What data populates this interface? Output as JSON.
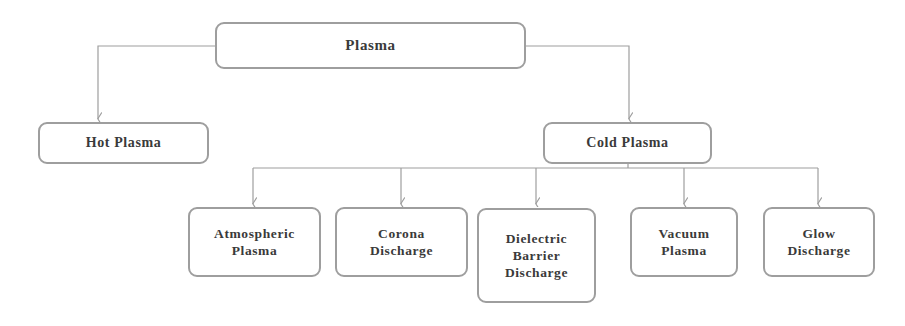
{
  "diagram": {
    "title": "Plasma",
    "type": "tree-flowchart",
    "orientation": "top-down",
    "canvas": {
      "width": 905,
      "height": 326
    },
    "style": {
      "box_border_color": "#9e9e9e",
      "box_fill_color": "#ffffff",
      "connector_color": "#9e9e9e",
      "text_color": "#3a3a3a",
      "background_color": "#ffffff"
    },
    "nodes": [
      {
        "id": "plasma",
        "label": "Plasma",
        "level": "root",
        "x": 215,
        "y": 22,
        "w": 311,
        "h": 47
      },
      {
        "id": "hot-plasma",
        "label": "Hot Plasma",
        "level": "mid",
        "x": 38,
        "y": 122,
        "w": 171,
        "h": 42
      },
      {
        "id": "cold-plasma",
        "label": "Cold Plasma",
        "level": "mid",
        "x": 543,
        "y": 122,
        "w": 169,
        "h": 42
      },
      {
        "id": "atmospheric-plasma",
        "label": "Atmospheric\nPlasma",
        "level": "leaf",
        "x": 188,
        "y": 207,
        "w": 133,
        "h": 70
      },
      {
        "id": "corona-discharge",
        "label": "Corona\nDischarge",
        "level": "leaf",
        "x": 335,
        "y": 207,
        "w": 133,
        "h": 70
      },
      {
        "id": "dielectric-barrier-discharge",
        "label": "Dielectric\nBarrier\nDischarge",
        "level": "leaf",
        "x": 477,
        "y": 208,
        "w": 119,
        "h": 95
      },
      {
        "id": "vacuum-plasma",
        "label": "Vacuum\nPlasma",
        "level": "leaf",
        "x": 630,
        "y": 207,
        "w": 108,
        "h": 70
      },
      {
        "id": "glow-discharge",
        "label": "Glow\nDischarge",
        "level": "leaf",
        "x": 763,
        "y": 207,
        "w": 112,
        "h": 70
      }
    ],
    "edges": [
      {
        "id": "plasma-to-hot-plasma",
        "from": "plasma",
        "to": "hot-plasma"
      },
      {
        "id": "plasma-to-cold-plasma",
        "from": "plasma",
        "to": "cold-plasma"
      },
      {
        "id": "cold-to-atmospheric",
        "from": "cold-plasma",
        "to": "atmospheric-plasma"
      },
      {
        "id": "cold-to-corona",
        "from": "cold-plasma",
        "to": "corona-discharge"
      },
      {
        "id": "cold-to-dbd",
        "from": "cold-plasma",
        "to": "dielectric-barrier-discharge"
      },
      {
        "id": "cold-to-vacuum",
        "from": "cold-plasma",
        "to": "vacuum-plasma"
      },
      {
        "id": "cold-to-glow",
        "from": "cold-plasma",
        "to": "glow-discharge"
      }
    ],
    "connector_geometry": {
      "root_side_exit_y": 46,
      "left_branch_x": 98,
      "right_branch_x": 629,
      "mid_row_top": 122,
      "cold_bus_y": 168,
      "cold_bus_x_start": 253,
      "cold_bus_x_end": 818,
      "cold_plasma_stem_x": 628,
      "leaf_arrow_xs": [
        253,
        401,
        536,
        684,
        818
      ],
      "leaf_row_top": 207
    }
  }
}
